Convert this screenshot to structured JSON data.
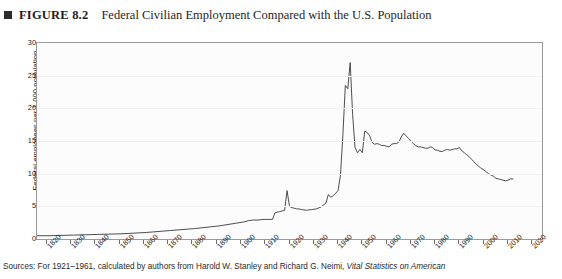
{
  "figure": {
    "bullet_icon": "filled-square-icon",
    "number_label": "FIGURE 8.2",
    "title": "Federal Civilian Employment Compared with the U.S. Population"
  },
  "source": {
    "prefix": "Sources: For 1921–1961, calculated by authors from Harold W. Stanley and Richard G. Neimi,",
    "italic_part": "Vital Statistics on American"
  },
  "colors": {
    "line": "#3a3a3a",
    "frame": "#9a9a9a",
    "plot_background": "#fcfcfc",
    "gridline": "#f0f0f0",
    "text": "#222222",
    "bullet": "#2b2b2b"
  },
  "chart_data": {
    "type": "line",
    "title": "Federal Civilian Employment Compared with the U.S. Population",
    "xlabel": "",
    "ylabel": "Federal employees per 1,000 population",
    "xlim": [
      1816,
      2024
    ],
    "ylim": [
      0,
      30
    ],
    "grid": true,
    "legend": "none",
    "x_ticks": [
      1820,
      1830,
      1840,
      1850,
      1860,
      1870,
      1880,
      1890,
      1900,
      1910,
      1920,
      1930,
      1940,
      1950,
      1960,
      1970,
      1980,
      1990,
      2000,
      2010,
      2020
    ],
    "y_ticks": [
      0,
      5,
      10,
      15,
      20,
      25,
      30
    ],
    "series": [
      {
        "name": "Federal employees per 1,000 population",
        "x": [
          1816,
          1821,
          1831,
          1841,
          1851,
          1861,
          1871,
          1881,
          1891,
          1901,
          1903,
          1905,
          1907,
          1909,
          1911,
          1912,
          1913,
          1914,
          1915,
          1916,
          1917,
          1918,
          1919,
          1920,
          1921,
          1922,
          1923,
          1924,
          1925,
          1927,
          1929,
          1931,
          1933,
          1935,
          1936,
          1937,
          1938,
          1939,
          1940,
          1941,
          1942,
          1943,
          1944,
          1945,
          1946,
          1947,
          1948,
          1949,
          1950,
          1951,
          1952,
          1953,
          1954,
          1955,
          1956,
          1957,
          1958,
          1959,
          1960,
          1961,
          1962,
          1963,
          1964,
          1965,
          1966,
          1967,
          1968,
          1969,
          1970,
          1971,
          1972,
          1973,
          1974,
          1975,
          1976,
          1977,
          1978,
          1979,
          1980,
          1981,
          1982,
          1983,
          1984,
          1985,
          1986,
          1987,
          1988,
          1989,
          1990,
          1991,
          1992,
          1993,
          1994,
          1995,
          1996,
          1997,
          1998,
          1999,
          2000,
          2001,
          2002,
          2003,
          2004,
          2005,
          2006,
          2007,
          2008,
          2009,
          2010,
          2011,
          2012
        ],
        "values": [
          0.5,
          0.5,
          0.6,
          0.7,
          0.8,
          1.0,
          1.3,
          1.6,
          2.0,
          2.6,
          2.8,
          2.9,
          2.9,
          3.0,
          3.0,
          3.0,
          3.0,
          4.0,
          4.1,
          4.2,
          4.3,
          4.4,
          7.4,
          5.0,
          4.8,
          4.7,
          4.6,
          4.6,
          4.5,
          4.4,
          4.5,
          4.6,
          4.9,
          5.5,
          6.8,
          6.4,
          6.6,
          7.0,
          7.4,
          9.8,
          16.0,
          23.5,
          23.0,
          27.0,
          19.0,
          14.0,
          13.2,
          13.7,
          13.2,
          16.5,
          16.3,
          15.8,
          14.8,
          14.5,
          14.6,
          14.5,
          14.3,
          14.3,
          14.2,
          14.1,
          14.5,
          14.6,
          14.6,
          14.8,
          15.6,
          16.2,
          15.8,
          15.4,
          15.0,
          14.6,
          14.3,
          14.1,
          14.1,
          14.0,
          13.9,
          13.9,
          14.1,
          14.0,
          13.6,
          13.6,
          13.4,
          13.4,
          13.6,
          13.7,
          13.6,
          13.7,
          13.8,
          13.8,
          14.0,
          13.5,
          13.2,
          12.9,
          12.6,
          12.2,
          11.8,
          11.4,
          11.1,
          10.8,
          10.6,
          10.3,
          10.0,
          9.8,
          9.6,
          9.3,
          9.2,
          9.1,
          9.0,
          8.9,
          9.0,
          9.2,
          9.2
        ]
      }
    ]
  }
}
